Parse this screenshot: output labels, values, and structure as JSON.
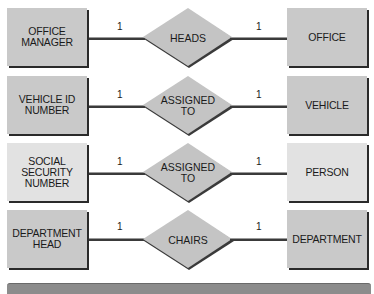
{
  "diagram": {
    "type": "entity-relationship",
    "colors": {
      "entity_fill": "#c9c9c9",
      "entity_fill_light": "#e2e2e2",
      "relationship_fill": "#c4c4c4",
      "line": "#3a3a3a",
      "footer_bar": "#8c8c8c"
    },
    "rows": [
      {
        "left_entity": [
          "OFFICE",
          "MANAGER"
        ],
        "left_cardinality": "1",
        "relationship": [
          "HEADS"
        ],
        "right_cardinality": "1",
        "right_entity": [
          "OFFICE"
        ]
      },
      {
        "left_entity": [
          "VEHICLE ID",
          "NUMBER"
        ],
        "left_cardinality": "1",
        "relationship": [
          "ASSIGNED",
          "TO"
        ],
        "right_cardinality": "1",
        "right_entity": [
          "VEHICLE"
        ]
      },
      {
        "left_entity": [
          "SOCIAL",
          "SECURITY",
          "NUMBER"
        ],
        "left_cardinality": "1",
        "relationship": [
          "ASSIGNED",
          "TO"
        ],
        "right_cardinality": "1",
        "right_entity": [
          "PERSON"
        ]
      },
      {
        "left_entity": [
          "DEPARTMENT",
          "HEAD"
        ],
        "left_cardinality": "1",
        "relationship": [
          "CHAIRS"
        ],
        "right_cardinality": "1",
        "right_entity": [
          "DEPARTMENT"
        ]
      }
    ]
  }
}
